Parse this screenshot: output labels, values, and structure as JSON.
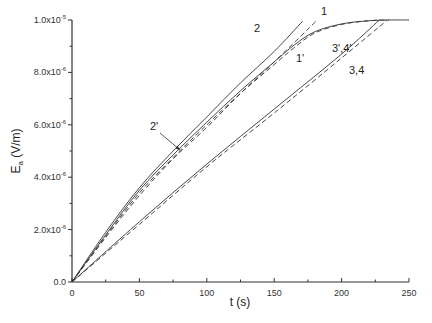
{
  "chart_data": {
    "type": "line",
    "title": "",
    "xlabel": "t (s)",
    "ylabel": "E_a (V/m)",
    "xlim": [
      0,
      250
    ],
    "ylim": [
      0,
      1e-05
    ],
    "grid": false,
    "legend": "none (inline curve labels)",
    "x_ticks": [
      0,
      50,
      100,
      150,
      200,
      250
    ],
    "x_tick_labels": [
      "0",
      "50",
      "100",
      "150",
      "200",
      "250"
    ],
    "y_ticks": [
      0,
      2e-06,
      4e-06,
      6e-06,
      8e-06,
      1e-05
    ],
    "y_tick_labels": [
      {
        "mantissa": "0.0",
        "exp": ""
      },
      {
        "mantissa": "2.0x10",
        "exp": "-6"
      },
      {
        "mantissa": "4.0x10",
        "exp": "-6"
      },
      {
        "mantissa": "6.0x10",
        "exp": "-6"
      },
      {
        "mantissa": "8.0x10",
        "exp": "-6"
      },
      {
        "mantissa": "1.0x10",
        "exp": "-5"
      }
    ],
    "y_unit_scale": 1e-06,
    "series": [
      {
        "name": "2",
        "style": "solid",
        "x": [
          0,
          25,
          50,
          75,
          100,
          125,
          150,
          171
        ],
        "y": [
          0,
          1.9e-06,
          3.6e-06,
          5e-06,
          6.3e-06,
          7.6e-06,
          8.8e-06,
          9.95e-06
        ]
      },
      {
        "name": "1",
        "style": "dashed",
        "x": [
          0,
          25,
          50,
          75,
          100,
          125,
          150,
          182
        ],
        "y": [
          0,
          1.7e-06,
          3.3e-06,
          4.7e-06,
          5.9e-06,
          7.2e-06,
          8.4e-06,
          1e-05
        ]
      },
      {
        "name": "2'",
        "style": "solid",
        "x": [
          0,
          25,
          50,
          75,
          100,
          125,
          150,
          165,
          180,
          200,
          220,
          235,
          250
        ],
        "y": [
          0,
          1.8e-06,
          3.5e-06,
          4.85e-06,
          6.1e-06,
          7.3e-06,
          8.4e-06,
          9.05e-06,
          9.55e-06,
          9.85e-06,
          9.97e-06,
          1e-05,
          1e-05
        ]
      },
      {
        "name": "1'",
        "style": "dashed",
        "x": [
          0,
          25,
          50,
          75,
          100,
          125,
          150,
          165,
          180,
          200,
          220,
          235
        ],
        "y": [
          0,
          1.75e-06,
          3.4e-06,
          4.75e-06,
          6e-06,
          7.2e-06,
          8.3e-06,
          8.95e-06,
          9.5e-06,
          9.83e-06,
          9.97e-06,
          1e-05
        ]
      },
      {
        "name": "3',4'",
        "style": "solid",
        "x": [
          0,
          50,
          100,
          150,
          200,
          228
        ],
        "y": [
          0,
          2.3e-06,
          4.5e-06,
          6.6e-06,
          8.7e-06,
          1e-05
        ]
      },
      {
        "name": "3,4",
        "style": "dashed",
        "x": [
          0,
          50,
          100,
          150,
          200,
          234
        ],
        "y": [
          0,
          2.2e-06,
          4.4e-06,
          6.45e-06,
          8.55e-06,
          1e-05
        ]
      }
    ],
    "annotations": [
      {
        "text": "2",
        "x_px": 254,
        "y_px": 32
      },
      {
        "text": "1",
        "x_px": 321,
        "y_px": 15
      },
      {
        "text": "1'",
        "x_px": 296,
        "y_px": 62
      },
      {
        "text": "3',4'",
        "x_px": 332,
        "y_px": 52
      },
      {
        "text": "3,4",
        "x_px": 349,
        "y_px": 74
      },
      {
        "text": "2'",
        "x_px": 150,
        "y_px": 130,
        "arrow_to_px": [
          180,
          150
        ]
      }
    ]
  }
}
